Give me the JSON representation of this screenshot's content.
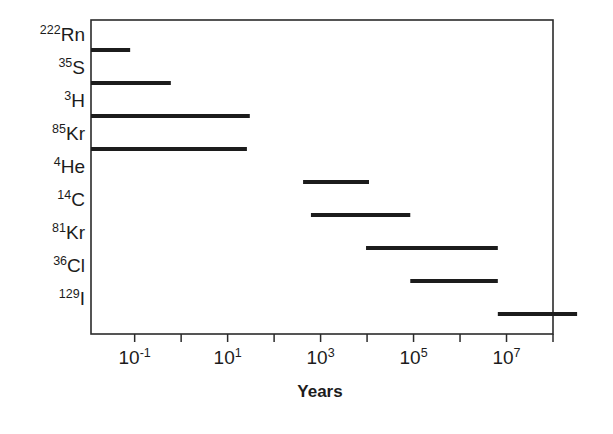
{
  "chart_data": {
    "type": "bar",
    "title": "",
    "subtitle": "",
    "xlabel": "Years",
    "ylabel": "",
    "orientation": "horizontal",
    "xscale": "log",
    "xlim": [
      0.0115,
      100000000.0
    ],
    "grid": false,
    "legend": false,
    "xticks": [
      {
        "value": 0.1,
        "base": "10",
        "exponent": "-1",
        "label": "10-1"
      },
      {
        "value": 10,
        "base": "10",
        "exponent": "1",
        "label": "101"
      },
      {
        "value": 1000,
        "base": "10",
        "exponent": "3",
        "label": "103"
      },
      {
        "value": 100000,
        "base": "10",
        "exponent": "5",
        "label": "105"
      },
      {
        "value": 10000000,
        "base": "10",
        "exponent": "7",
        "label": "107"
      }
    ],
    "minor_xticks": [
      1,
      100,
      10000,
      1000000,
      100000000
    ],
    "categories": [
      "222Rn",
      "35S",
      "3H",
      "85Kr",
      "4He",
      "14C",
      "81Kr",
      "36Cl",
      "129I"
    ],
    "series": [
      {
        "name": "Dating range",
        "bars": [
          {
            "label_mass": "222",
            "label_element": "Rn",
            "start": 0.0115,
            "end": 0.08,
            "start_clipped": true
          },
          {
            "label_mass": "35",
            "label_element": "S",
            "start": 0.0115,
            "end": 0.6,
            "start_clipped": true
          },
          {
            "label_mass": "3",
            "label_element": "H",
            "start": 0.0115,
            "end": 30,
            "start_clipped": true
          },
          {
            "label_mass": "85",
            "label_element": "Kr",
            "start": 0.0115,
            "end": 26,
            "start_clipped": true
          },
          {
            "label_mass": "4",
            "label_element": "He",
            "start": 420,
            "end": 11000,
            "start_clipped": false
          },
          {
            "label_mass": "14",
            "label_element": "C",
            "start": 620,
            "end": 85000,
            "start_clipped": false
          },
          {
            "label_mass": "81",
            "label_element": "Kr",
            "start": 9500,
            "end": 6500000,
            "start_clipped": false
          },
          {
            "label_mass": "36",
            "label_element": "Cl",
            "start": 85000,
            "end": 6500000,
            "start_clipped": false
          },
          {
            "label_mass": "129",
            "label_element": "I",
            "start": 6500000,
            "end": 330000000,
            "start_clipped": false
          }
        ]
      }
    ]
  },
  "colors": {
    "background": "#ffffff",
    "ink": "#1c1c1c",
    "frame": "#2b2b2b"
  }
}
